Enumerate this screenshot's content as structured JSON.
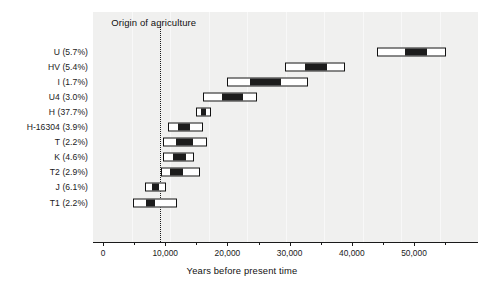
{
  "chart_data": {
    "type": "bar",
    "title": "",
    "xlabel": "Years before present time",
    "ylabel": "",
    "xlim": [
      0,
      56000
    ],
    "grid": false,
    "legend": null,
    "orientation": "horizontal",
    "bar_style": "interval bars: outer white box = confidence interval, inner black box = point-estimate range",
    "xticks": [
      0,
      10000,
      20000,
      30000,
      40000,
      50000
    ],
    "xticklabels": [
      "0",
      "10,000",
      "20,000",
      "30,000",
      "40,000",
      "50,000"
    ],
    "xticks_minor": [
      5000,
      15000,
      25000,
      35000,
      45000,
      55000
    ],
    "categories": [
      "U (5.7%)",
      "HV (5.4%)",
      "I (1.7%)",
      "U4 (3.0%)",
      "H (37.7%)",
      "H-16304 (3.9%)",
      "T (2.2%)",
      "K (4.6%)",
      "T2 (2.9%)",
      "J (6.1%)",
      "T1 (2.2%)"
    ],
    "annotations": [
      {
        "label": "Origin of agriculture",
        "x": 9200,
        "style": "vertical dotted line"
      }
    ],
    "series": [
      {
        "name": "Confidence interval (outer white bar)",
        "intervals": [
          [
            44100,
            55200
          ],
          [
            29300,
            38900
          ],
          [
            19900,
            33000
          ],
          [
            16100,
            24800
          ],
          [
            14900,
            17400
          ],
          [
            10400,
            16100
          ],
          [
            9600,
            16700
          ],
          [
            9600,
            14600
          ],
          [
            9300,
            15600
          ],
          [
            6800,
            10100
          ],
          [
            4800,
            11900
          ]
        ]
      },
      {
        "name": "Point-estimate range (inner black bar)",
        "intervals": [
          [
            48600,
            52100
          ],
          [
            32500,
            36000
          ],
          [
            23600,
            28600
          ],
          [
            19100,
            22500
          ],
          [
            15800,
            16600
          ],
          [
            12100,
            14000
          ],
          [
            11700,
            14500
          ],
          [
            11300,
            13300
          ],
          [
            10800,
            12900
          ],
          [
            7900,
            9000
          ],
          [
            6900,
            8400
          ]
        ]
      }
    ],
    "rows": [
      {
        "label": "U (5.7%)",
        "ci_low": 44100,
        "ci_high": 55200,
        "est_low": 48600,
        "est_high": 52100
      },
      {
        "label": "HV (5.4%)",
        "ci_low": 29300,
        "ci_high": 38900,
        "est_low": 32500,
        "est_high": 36000
      },
      {
        "label": "I (1.7%)",
        "ci_low": 19900,
        "ci_high": 33000,
        "est_low": 23600,
        "est_high": 28600
      },
      {
        "label": "U4 (3.0%)",
        "ci_low": 16100,
        "ci_high": 24800,
        "est_low": 19100,
        "est_high": 22500
      },
      {
        "label": "H (37.7%)",
        "ci_low": 14900,
        "ci_high": 17400,
        "est_low": 15800,
        "est_high": 16600
      },
      {
        "label": "H-16304 (3.9%)",
        "ci_low": 10400,
        "ci_high": 16100,
        "est_low": 12100,
        "est_high": 14000
      },
      {
        "label": "T (2.2%)",
        "ci_low": 9600,
        "ci_high": 16700,
        "est_low": 11700,
        "est_high": 14500
      },
      {
        "label": "K (4.6%)",
        "ci_low": 9600,
        "ci_high": 14600,
        "est_low": 11300,
        "est_high": 13300
      },
      {
        "label": "T2 (2.9%)",
        "ci_low": 9300,
        "ci_high": 15600,
        "est_low": 10800,
        "est_high": 12900
      },
      {
        "label": "J (6.1%)",
        "ci_low": 6800,
        "ci_high": 10100,
        "est_low": 7900,
        "est_high": 9000
      },
      {
        "label": "T1 (2.2%)",
        "ci_low": 4800,
        "ci_high": 11900,
        "est_low": 6900,
        "est_high": 8400
      }
    ],
    "colors": {
      "plot_background": "#f0f0ef",
      "bar_fill": "#ffffff",
      "bar_core": "#1c1c1c",
      "bar_outline": "#111111",
      "axis": "#1a1a1a",
      "text": "#1a1a1a"
    }
  },
  "axis": {
    "x_title": "Years before present time"
  },
  "annotation": {
    "origin_label": "Origin of agriculture"
  }
}
